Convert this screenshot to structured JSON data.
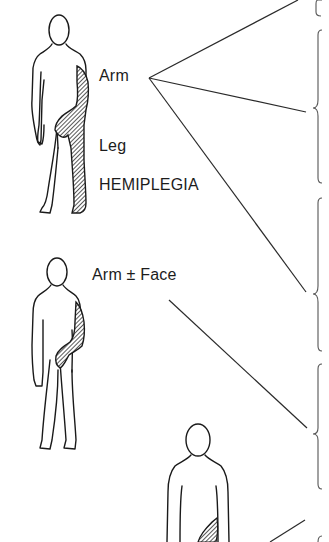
{
  "diagram": {
    "figures": [
      {
        "id": "hemiplegia-figure",
        "labels": {
          "arm": "Arm",
          "leg": "Leg",
          "title": "HEMIPLEGIA"
        },
        "affected": [
          "arm",
          "leg"
        ]
      },
      {
        "id": "monoplegia-arm-figure",
        "labels": {
          "arm_face": "Arm ± Face"
        },
        "affected": [
          "arm"
        ]
      },
      {
        "id": "partial-figure",
        "labels": {},
        "affected": [
          "hand-region"
        ]
      }
    ],
    "braces_count": 5,
    "colors": {
      "line": "#2a2a2a",
      "brace": "#555555",
      "hatch": "#3a3a3a",
      "background": "#ffffff"
    }
  }
}
